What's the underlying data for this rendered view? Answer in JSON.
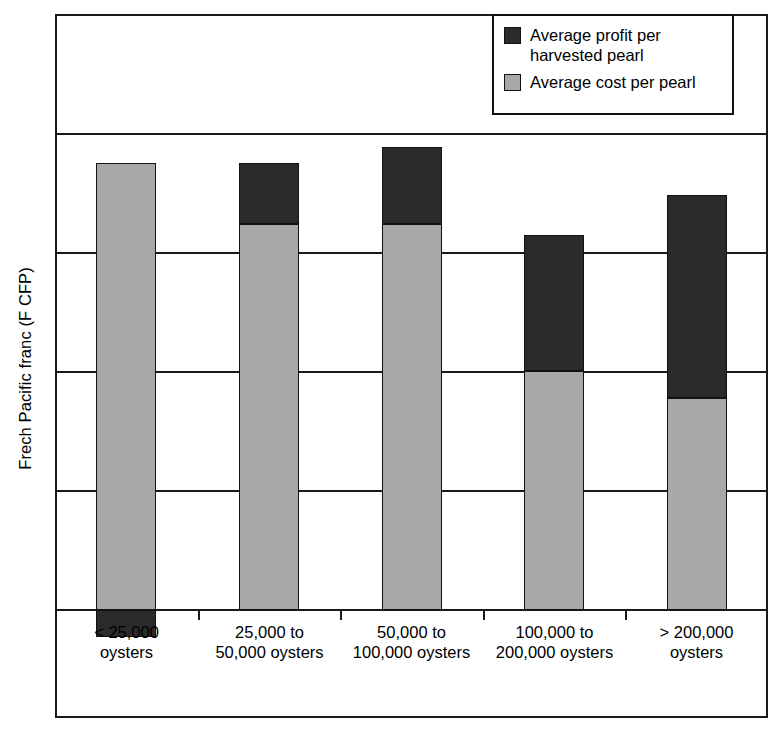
{
  "chart_data": {
    "type": "bar",
    "subtype": "stacked-bar",
    "title": "",
    "subtitle": "",
    "xlabel": "",
    "ylabel": "Frech Pacific franc (F CFP)",
    "categories": [
      "< 25,000\noysters",
      "25,000 to\n50,000 oysters",
      "50,000 to\n100,000 oysters",
      "100,000 to\n200,000 oysters",
      "> 200,000\noysters"
    ],
    "series": [
      {
        "name": "Average cost per pearl",
        "color": "#a8a8a8",
        "values": [
          3.76,
          3.24,
          3.24,
          2.01,
          1.78
        ]
      },
      {
        "name": "Average profit per harvested pearl",
        "color": "#2b2b2b",
        "values": [
          -0.23,
          0.52,
          0.65,
          1.14,
          1.71
        ]
      }
    ],
    "stack_order": [
      "Average cost per pearl",
      "Average profit per harvested pearl"
    ],
    "ylim": [
      -1,
      4
    ],
    "y_gridlines": [
      0,
      1,
      2,
      3,
      4
    ],
    "y_tick_labels": [],
    "grid": true,
    "legend_position": "top-right"
  },
  "axis": {
    "y_title": "Frech Pacific franc (F CFP)"
  },
  "legend": {
    "entries": [
      {
        "label": "Average profit per\nharvested pearl",
        "swatch": "dark-swatch-icon"
      },
      {
        "label": "Average cost per pearl",
        "swatch": "gray-swatch-icon"
      }
    ]
  },
  "colors": {
    "cost": "#a8a8a8",
    "profit": "#2b2b2b",
    "frame": "#1a1a1a",
    "background": "#ffffff"
  }
}
